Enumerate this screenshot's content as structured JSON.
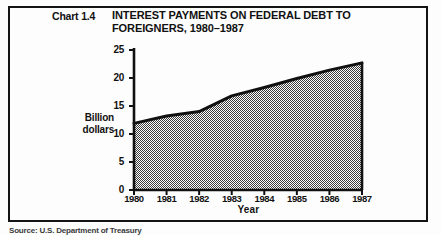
{
  "figure": {
    "chart_number": "Chart 1.4",
    "title_line1": "INTEREST PAYMENTS ON FEDERAL DEBT TO",
    "title_line2": "FOREIGNERS,  1980–1987",
    "source_note": "Source:  U.S. Department of Treasury",
    "ink_color": "#111111",
    "fill_pattern_color": "#a9a9a9",
    "background_color": "#fdfdfd"
  },
  "axes": {
    "y_title_line1": "Billion",
    "y_title_line2": "dollars",
    "x_title": "Year",
    "y_ticks": [
      "0",
      "5",
      "10",
      "15",
      "20",
      "25"
    ],
    "x_ticks": [
      "1980",
      "1981",
      "1982",
      "1983",
      "1984",
      "1985",
      "1986",
      "1987"
    ]
  },
  "chart_data": {
    "type": "area",
    "subtitle": "Chart 1.4",
    "xlabel": "Year",
    "ylabel": "Billion dollars",
    "x": [
      1980,
      1981,
      1982,
      1983,
      1984,
      1985,
      1986,
      1987
    ],
    "categories": [
      "1980",
      "1981",
      "1982",
      "1983",
      "1984",
      "1985",
      "1986",
      "1987"
    ],
    "values": [
      11.9,
      13.2,
      14.0,
      16.8,
      18.3,
      19.9,
      21.4,
      22.7
    ],
    "series": [
      {
        "name": "Interest payments on federal debt to foreigners",
        "values": [
          11.9,
          13.2,
          14.0,
          16.8,
          18.3,
          19.9,
          21.4,
          22.7
        ]
      }
    ],
    "ylim": [
      0,
      25
    ],
    "xlim": [
      1980,
      1987
    ],
    "y_ticks": [
      0,
      5,
      10,
      15,
      20,
      25
    ],
    "grid": false,
    "legend": false,
    "fill": "50% dither gray",
    "line_color": "#111111"
  }
}
